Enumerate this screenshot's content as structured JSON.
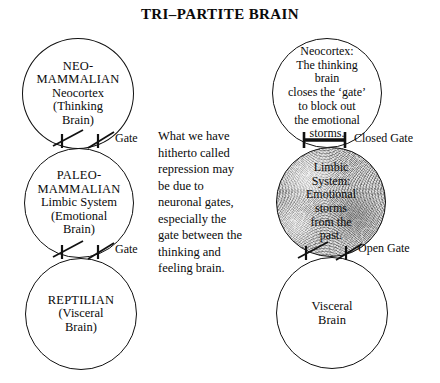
{
  "title": "TRI–PARTITE BRAIN",
  "left_column": {
    "circles": [
      {
        "name": "neo-mammalian",
        "line1": "NEO-",
        "line2": "MAMMALIAN",
        "line3": "Neocortex",
        "line4": "(Thinking",
        "line5": "Brain)"
      },
      {
        "name": "paleo-mammalian",
        "line1": "PALEO-",
        "line2": "MAMMALIAN",
        "line3": "Limbic System",
        "line4": "(Emotional",
        "line5": "Brain)"
      },
      {
        "name": "reptilian",
        "line1": "REPTILIAN",
        "line2": "(Visceral",
        "line3": "Brain)"
      }
    ],
    "gates": [
      {
        "name": "gate-upper",
        "label": "Gate",
        "state": "open"
      },
      {
        "name": "gate-lower",
        "label": "Gate",
        "state": "open"
      }
    ]
  },
  "center_text": {
    "lines": [
      "What we have",
      "hitherto called",
      "repression may",
      "be due to",
      "neuronal gates,",
      "especially the",
      "gate between the",
      "thinking and",
      "feeling brain."
    ]
  },
  "right_column": {
    "circles": [
      {
        "name": "neocortex-detail",
        "line1": "Neocortex:",
        "line2": "The thinking",
        "line3": "brain",
        "line4": "closes the ‘gate’",
        "line5": "to block out",
        "line6": "the emotional",
        "line7": "storms."
      },
      {
        "name": "limbic-detail",
        "line1": "Limbic",
        "line2": "System:",
        "line3": "Emotional",
        "line4": "storms",
        "line5": "from the",
        "line6": "past."
      },
      {
        "name": "visceral-brain",
        "line1": "Visceral",
        "line2": "Brain"
      }
    ],
    "gates": [
      {
        "name": "closed-gate",
        "label": "Closed Gate",
        "state": "closed"
      },
      {
        "name": "open-gate",
        "label": "Open Gate",
        "state": "open"
      }
    ]
  },
  "colors": {
    "ink": "#0a0a0a",
    "stroke": "#111111",
    "background": "#ffffff",
    "limbic_fill": "#bdbdbd"
  }
}
